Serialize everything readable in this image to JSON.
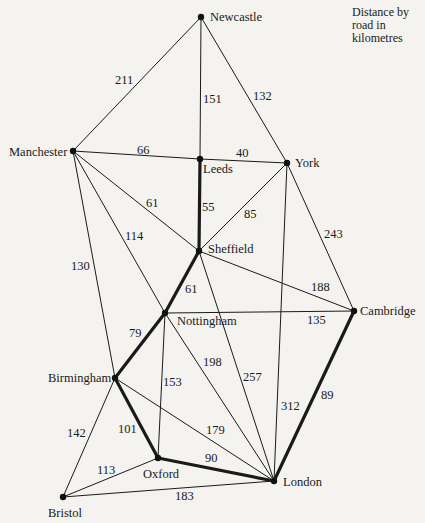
{
  "legend": {
    "text_lines": [
      "Distance by",
      "road in",
      "kilometres"
    ]
  },
  "nodes": [
    {
      "id": "newcastle",
      "label": "Newcastle",
      "x": 201,
      "y": 17,
      "lx": 210,
      "ly": 21,
      "anchor": "start"
    },
    {
      "id": "manchester",
      "label": "Manchester",
      "x": 73,
      "y": 151,
      "lx": 9,
      "ly": 156,
      "anchor": "start"
    },
    {
      "id": "leeds",
      "label": "Leeds",
      "x": 200,
      "y": 159,
      "lx": 203,
      "ly": 173,
      "anchor": "start"
    },
    {
      "id": "york",
      "label": "York",
      "x": 287,
      "y": 163,
      "lx": 295,
      "ly": 167,
      "anchor": "start"
    },
    {
      "id": "sheffield",
      "label": "Sheffield",
      "x": 199,
      "y": 251,
      "lx": 208,
      "ly": 253,
      "anchor": "start"
    },
    {
      "id": "nottingham",
      "label": "Nottingham",
      "x": 165,
      "y": 313,
      "lx": 177,
      "ly": 325,
      "anchor": "start"
    },
    {
      "id": "cambridge",
      "label": "Cambridge",
      "x": 354,
      "y": 311,
      "lx": 360,
      "ly": 315,
      "anchor": "start"
    },
    {
      "id": "birmingham",
      "label": "Birmingham",
      "x": 115,
      "y": 378,
      "lx": 48,
      "ly": 382,
      "anchor": "start"
    },
    {
      "id": "oxford",
      "label": "Oxford",
      "x": 158,
      "y": 458,
      "lx": 143,
      "ly": 478,
      "anchor": "start"
    },
    {
      "id": "bristol",
      "label": "Bristol",
      "x": 63,
      "y": 497,
      "lx": 48,
      "ly": 517,
      "anchor": "start"
    },
    {
      "id": "london",
      "label": "London",
      "x": 274,
      "y": 481,
      "lx": 283,
      "ly": 486,
      "anchor": "start"
    }
  ],
  "edges": [
    {
      "from": "newcastle",
      "to": "manchester",
      "weight": "211",
      "bold": false,
      "wx": 115,
      "wy": 84
    },
    {
      "from": "newcastle",
      "to": "leeds",
      "weight": "151",
      "bold": false,
      "wx": 203,
      "wy": 103
    },
    {
      "from": "newcastle",
      "to": "york",
      "weight": "132",
      "bold": false,
      "wx": 253,
      "wy": 100
    },
    {
      "from": "manchester",
      "to": "leeds",
      "weight": "66",
      "bold": false,
      "wx": 137,
      "wy": 154
    },
    {
      "from": "leeds",
      "to": "york",
      "weight": "40",
      "bold": false,
      "wx": 236,
      "wy": 157
    },
    {
      "from": "leeds",
      "to": "sheffield",
      "weight": "55",
      "bold": true,
      "wx": 202,
      "wy": 211
    },
    {
      "from": "manchester",
      "to": "sheffield",
      "weight": "61",
      "bold": false,
      "wx": 146,
      "wy": 207
    },
    {
      "from": "manchester",
      "to": "nottingham",
      "weight": "114",
      "bold": false,
      "wx": 125,
      "wy": 240
    },
    {
      "from": "manchester",
      "to": "birmingham",
      "weight": "130",
      "bold": false,
      "wx": 71,
      "wy": 270
    },
    {
      "from": "york",
      "to": "sheffield",
      "weight": "85",
      "bold": false,
      "wx": 244,
      "wy": 218
    },
    {
      "from": "york",
      "to": "cambridge",
      "weight": "243",
      "bold": false,
      "wx": 324,
      "wy": 238
    },
    {
      "from": "york",
      "to": "london",
      "weight": "312",
      "bold": false,
      "wx": 281,
      "wy": 410
    },
    {
      "from": "sheffield",
      "to": "nottingham",
      "weight": "61",
      "bold": true,
      "wx": 185,
      "wy": 293
    },
    {
      "from": "sheffield",
      "to": "cambridge",
      "weight": "188",
      "bold": false,
      "wx": 311,
      "wy": 291
    },
    {
      "from": "sheffield",
      "to": "london",
      "weight": "257",
      "bold": false,
      "wx": 243,
      "wy": 381
    },
    {
      "from": "nottingham",
      "to": "cambridge",
      "weight": "135",
      "bold": false,
      "wx": 307,
      "wy": 324
    },
    {
      "from": "nottingham",
      "to": "birmingham",
      "weight": "79",
      "bold": true,
      "wx": 129,
      "wy": 337
    },
    {
      "from": "nottingham",
      "to": "oxford",
      "weight": "153",
      "bold": false,
      "wx": 163,
      "wy": 386
    },
    {
      "from": "nottingham",
      "to": "london",
      "weight": "198",
      "bold": false,
      "wx": 203,
      "wy": 366
    },
    {
      "from": "cambridge",
      "to": "london",
      "weight": "89",
      "bold": true,
      "wx": 321,
      "wy": 399
    },
    {
      "from": "birmingham",
      "to": "oxford",
      "weight": "101",
      "bold": true,
      "wx": 118,
      "wy": 433
    },
    {
      "from": "birmingham",
      "to": "bristol",
      "weight": "142",
      "bold": false,
      "wx": 67,
      "wy": 437
    },
    {
      "from": "birmingham",
      "to": "london",
      "weight": "179",
      "bold": false,
      "wx": 206,
      "wy": 434
    },
    {
      "from": "oxford",
      "to": "london",
      "weight": "90",
      "bold": true,
      "wx": 205,
      "wy": 462
    },
    {
      "from": "oxford",
      "to": "bristol",
      "weight": "113",
      "bold": false,
      "wx": 97,
      "wy": 474
    },
    {
      "from": "bristol",
      "to": "london",
      "weight": "183",
      "bold": false,
      "wx": 175,
      "wy": 500
    }
  ]
}
